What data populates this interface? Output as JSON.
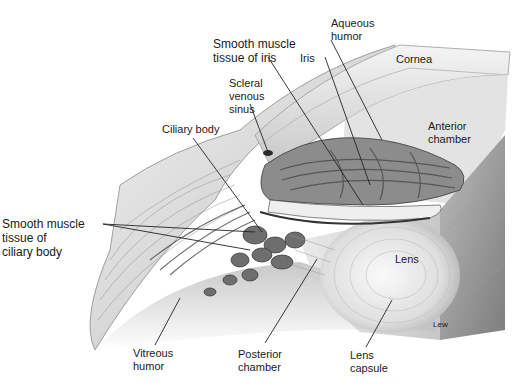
{
  "diagram": {
    "labels": {
      "aqueous_humor": "Aqueous\nhumor",
      "smooth_muscle_iris": "Smooth muscle\ntissue of iris",
      "iris": "Iris",
      "cornea": "Cornea",
      "scleral_venous_sinus": "Scleral\nvenous\nsinus",
      "ciliary_body": "Ciliary body",
      "anterior_chamber": "Anterior\nchamber",
      "smooth_muscle_ciliary": "Smooth muscle\ntissue of\nciliary body",
      "lens": "Lens",
      "artist": "Lew",
      "vitreous_humor": "Vitreous\nhumor",
      "posterior_chamber": "Posterior\nchamber",
      "lens_capsule": "Lens\ncapsule"
    },
    "colors": {
      "background": "#ffffff",
      "text": "#1a1a1a",
      "leader_line": "#222222",
      "tissue_light": "#e6e6e6",
      "tissue_mid": "#a8a8a8",
      "tissue_dark": "#555555"
    }
  }
}
